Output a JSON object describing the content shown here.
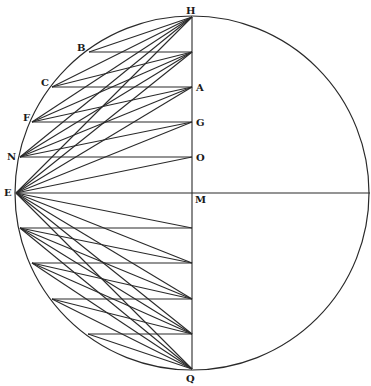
{
  "circle": {
    "cx": 192,
    "cy": 193,
    "r": 177
  },
  "axis": {
    "top": [
      192,
      17
    ],
    "bottom": [
      192,
      369
    ],
    "horizontal_end": [
      370,
      193
    ]
  },
  "upper_axis_points": [
    {
      "name": "H",
      "x": 192,
      "y": 17
    },
    {
      "name": "",
      "x": 192,
      "y": 52
    },
    {
      "name": "A",
      "x": 192,
      "y": 87
    },
    {
      "name": "G",
      "x": 192,
      "y": 122
    },
    {
      "name": "O",
      "x": 192,
      "y": 157
    },
    {
      "name": "M",
      "x": 192,
      "y": 193
    }
  ],
  "upper_circle_points": [
    {
      "name": "B",
      "x": 89,
      "y": 52
    },
    {
      "name": "C",
      "x": 52,
      "y": 87
    },
    {
      "name": "F",
      "x": 32,
      "y": 122
    },
    {
      "name": "N",
      "x": 20,
      "y": 157
    },
    {
      "name": "E",
      "x": 16,
      "y": 193
    }
  ],
  "lower_axis_points": [
    {
      "name": "M",
      "x": 192,
      "y": 193
    },
    {
      "name": "",
      "x": 192,
      "y": 228
    },
    {
      "name": "",
      "x": 192,
      "y": 263
    },
    {
      "name": "",
      "x": 192,
      "y": 299
    },
    {
      "name": "",
      "x": 192,
      "y": 334
    },
    {
      "name": "Q",
      "x": 192,
      "y": 369
    }
  ],
  "lower_circle_points": [
    {
      "name": "E",
      "x": 16,
      "y": 193
    },
    {
      "name": "",
      "x": 20,
      "y": 228
    },
    {
      "name": "",
      "x": 32,
      "y": 263
    },
    {
      "name": "",
      "x": 52,
      "y": 299
    },
    {
      "name": "",
      "x": 88,
      "y": 334
    }
  ],
  "labels": [
    {
      "text": "H",
      "x": 186,
      "y": 14
    },
    {
      "text": "B",
      "x": 77,
      "y": 51
    },
    {
      "text": "C",
      "x": 41,
      "y": 86
    },
    {
      "text": "A",
      "x": 196,
      "y": 91
    },
    {
      "text": "F",
      "x": 23,
      "y": 121
    },
    {
      "text": "G",
      "x": 196,
      "y": 126
    },
    {
      "text": "N",
      "x": 7,
      "y": 160
    },
    {
      "text": "O",
      "x": 196,
      "y": 161
    },
    {
      "text": "E",
      "x": 4,
      "y": 196
    },
    {
      "text": "M",
      "x": 195,
      "y": 203
    },
    {
      "text": "Q",
      "x": 186,
      "y": 382
    }
  ]
}
